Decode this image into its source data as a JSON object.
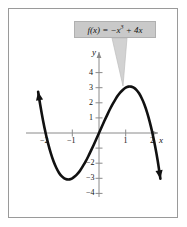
{
  "figure": {
    "border_color": "#9a9a9a",
    "background": "#ffffff"
  },
  "callout": {
    "name": "function-label",
    "text": "f(x) = −x³ + 4x",
    "text_prefix": "f(x) = −x",
    "text_exponent": "3",
    "text_suffix": " + 4x",
    "box_color": "#c9c9c9",
    "leader_color": "#bdbdbd"
  },
  "axes": {
    "x_name": "x",
    "y_name": "y",
    "curve_color": "#111111",
    "axis_color": "#8a8a8a",
    "x_ticks": [
      {
        "value": -2,
        "label": "−2"
      },
      {
        "value": -1,
        "label": "−1"
      },
      {
        "value": 1,
        "label": "1"
      },
      {
        "value": 2,
        "label": "2"
      }
    ],
    "y_ticks": [
      {
        "value": 4,
        "label": "4"
      },
      {
        "value": 3,
        "label": "3"
      },
      {
        "value": 2,
        "label": "2"
      },
      {
        "value": 1,
        "label": "1"
      },
      {
        "value": -2,
        "label": "−2"
      },
      {
        "value": -3,
        "label": "−3"
      },
      {
        "value": -4,
        "label": "−4"
      }
    ]
  },
  "chart_data": {
    "type": "line",
    "xlabel": "x",
    "ylabel": "y",
    "xlim": [
      -2.35,
      2.45
    ],
    "ylim": [
      -4.6,
      4.7
    ],
    "grid": false,
    "legend": "none",
    "annotations": [
      {
        "text": "f(x) = −x³ + 4x",
        "type": "callout",
        "points_to_x": 1.15,
        "points_to_y": 3.1
      }
    ],
    "series": [
      {
        "name": "f(x) = -x^3 + 4x",
        "color": "#111111",
        "arrow_start": true,
        "arrow_end": true,
        "x": [
          -2.28,
          -2.2,
          -2.1,
          -2.0,
          -1.9,
          -1.8,
          -1.7,
          -1.6,
          -1.5,
          -1.4,
          -1.3,
          -1.2,
          -1.1,
          -1.0,
          -0.9,
          -0.8,
          -0.7,
          -0.6,
          -0.5,
          -0.4,
          -0.3,
          -0.2,
          -0.1,
          0.0,
          0.1,
          0.2,
          0.3,
          0.4,
          0.5,
          0.6,
          0.7,
          0.8,
          0.9,
          1.0,
          1.1,
          1.2,
          1.3,
          1.4,
          1.5,
          1.6,
          1.7,
          1.8,
          1.9,
          2.0,
          2.1,
          2.2,
          2.3
        ],
        "y": [
          2.73,
          1.85,
          0.86,
          0.0,
          -0.74,
          -1.37,
          -1.89,
          -2.3,
          -2.63,
          -2.86,
          -3.0,
          -3.07,
          -3.07,
          -3.0,
          -2.87,
          -2.69,
          -2.46,
          -2.18,
          -1.88,
          -1.54,
          -1.17,
          -0.79,
          -0.4,
          0.0,
          0.4,
          0.79,
          1.17,
          1.54,
          1.88,
          2.18,
          2.46,
          2.69,
          2.87,
          3.0,
          3.07,
          3.07,
          3.0,
          2.86,
          2.63,
          2.3,
          1.89,
          1.37,
          0.74,
          0.0,
          -0.86,
          -1.85,
          -3.03
        ]
      }
    ],
    "local_max": {
      "x": 1.155,
      "y": 3.08
    },
    "local_min": {
      "x": -1.155,
      "y": -3.08
    },
    "x_intercepts": [
      -2,
      0,
      2
    ]
  }
}
